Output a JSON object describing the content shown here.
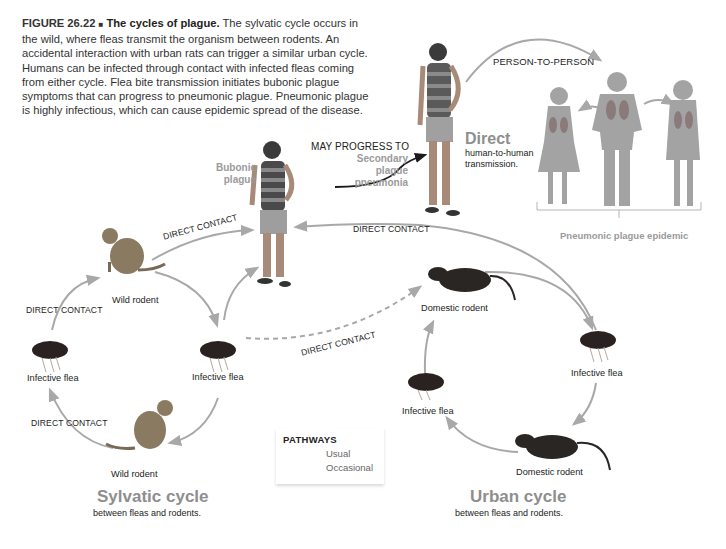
{
  "caption": {
    "figure_number": "FIGURE 26.22",
    "separator": "■",
    "title": "The cycles of plague.",
    "body": "The sylvatic cycle occurs in the wild, where fleas transmit the organism between rodents. An accidental interaction with urban rats can trigger a similar urban cycle. Humans can be infected through contact with infected fleas coming from either cycle. Flea bite transmission initiates bubonic plague symptoms that can progress to pneumonic plague. Pneumonic plague is highly infectious, which can cause epidemic spread of the disease."
  },
  "human": {
    "bubonic_label_1": "Bubonic",
    "bubonic_label_2": "plague",
    "progress_label": "MAY PROGRESS TO",
    "secondary_1": "Secondary",
    "secondary_2": "plague",
    "secondary_3": "pneumonia",
    "direct_title": "Direct",
    "direct_sub_1": "human-to-human",
    "direct_sub_2": "transmission.",
    "person_to_person": "PERSON-TO-PERSON",
    "epidemic_label": "Pneumonic plague epidemic"
  },
  "sylvatic": {
    "wild_rodent_top": "Wild rodent",
    "wild_rodent_bottom": "Wild rodent",
    "flea_left": "Infective flea",
    "flea_right": "Infective flea",
    "contact_top_left": "DIRECT CONTACT",
    "contact_bottom_left": "DIRECT CONTACT",
    "contact_to_human": "DIRECT CONTACT",
    "contact_occasional": "DIRECT CONTACT",
    "title": "Sylvatic cycle",
    "subtitle": "between fleas and rodents."
  },
  "urban": {
    "domestic_rodent_top": "Domestic rodent",
    "domestic_rodent_bottom": "Domestic rodent",
    "flea_right": "Infective flea",
    "flea_left": "Infective flea",
    "contact_to_human": "DIRECT CONTACT",
    "title": "Urban cycle",
    "subtitle": "between fleas and rodents."
  },
  "legend": {
    "title": "PATHWAYS",
    "items": [
      {
        "label": "Usual",
        "style": "solid"
      },
      {
        "label": "Occasional",
        "style": "dashed"
      }
    ]
  },
  "colors": {
    "arrow": "#a8a8a8",
    "black_arrow": "#1a1a1a",
    "label_gray": "#9a9a9a",
    "silhouette": "#a3a3a3"
  }
}
